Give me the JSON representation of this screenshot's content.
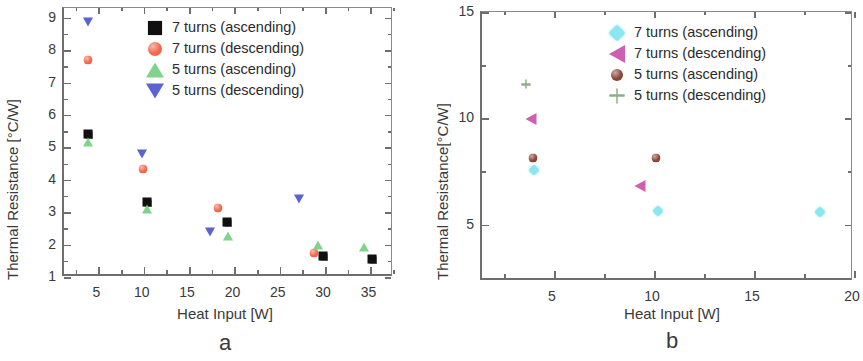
{
  "figure": {
    "panels": [
      {
        "id": "a",
        "letter": "a",
        "xlabel": "Heat Input [W]",
        "ylabel": "Thermal Resistance [°C/W]"
      },
      {
        "id": "b",
        "letter": "b",
        "xlabel": "Heat Input [W]",
        "ylabel": "Thermal Resistance[°C/W]"
      }
    ]
  },
  "chart_data": [
    {
      "type": "scatter",
      "panel": "a",
      "title": "",
      "xlabel": "Heat Input [W]",
      "ylabel": "Thermal Resistance [°C/W]",
      "xlim": [
        1.2,
        37.6
      ],
      "ylim": [
        1,
        9.3
      ],
      "xticks": [
        5,
        10,
        15,
        20,
        25,
        30,
        35
      ],
      "yticks": [
        1,
        2,
        3,
        4,
        5,
        6,
        7,
        8,
        9
      ],
      "xtick_labels": [
        "5",
        "10",
        "15",
        "20",
        "25",
        "30",
        "35"
      ],
      "ytick_labels": [
        "1",
        "2",
        "3",
        "4",
        "5",
        "6",
        "7",
        "8",
        "9"
      ],
      "xminor_step": 2.5,
      "yminor_step": 0.5,
      "grid": false,
      "legend_position": "top-right",
      "series": [
        {
          "name": "7 turns (ascending)",
          "marker": "square",
          "color": "#101010",
          "points": [
            {
              "x": 3.9,
              "y": 5.42
            },
            {
              "x": 10.4,
              "y": 3.32
            },
            {
              "x": 19.2,
              "y": 2.69
            },
            {
              "x": 29.8,
              "y": 1.65
            },
            {
              "x": 35.2,
              "y": 1.55
            }
          ]
        },
        {
          "name": "7 turns (descending)",
          "marker": "circle",
          "color": "#f2664c",
          "points": [
            {
              "x": 3.8,
              "y": 7.7
            },
            {
              "x": 9.9,
              "y": 4.33
            },
            {
              "x": 18.2,
              "y": 3.14
            },
            {
              "x": 28.8,
              "y": 1.73
            }
          ]
        },
        {
          "name": "5 turns (ascending)",
          "marker": "triangle-up",
          "color": "#7fd38a",
          "points": [
            {
              "x": 3.9,
              "y": 5.18
            },
            {
              "x": 10.4,
              "y": 3.11
            },
            {
              "x": 19.3,
              "y": 2.25
            },
            {
              "x": 29.2,
              "y": 1.98
            },
            {
              "x": 34.3,
              "y": 1.92
            }
          ]
        },
        {
          "name": "5 turns (descending)",
          "marker": "triangle-down",
          "color": "#5a63cf",
          "points": [
            {
              "x": 3.8,
              "y": 8.87
            },
            {
              "x": 9.8,
              "y": 4.8
            },
            {
              "x": 17.3,
              "y": 2.4
            },
            {
              "x": 27.1,
              "y": 3.4
            }
          ]
        }
      ]
    },
    {
      "type": "scatter",
      "panel": "b",
      "title": "",
      "xlabel": "Heat Input [W]",
      "ylabel": "Thermal Resistance[°C/W]",
      "xlim": [
        1.4,
        20
      ],
      "ylim": [
        2.35,
        15
      ],
      "xticks": [
        5,
        10,
        15,
        20
      ],
      "yticks": [
        5,
        10,
        15
      ],
      "xtick_labels": [
        "5",
        "10",
        "15",
        "20"
      ],
      "ytick_labels": [
        "5",
        "10",
        "15"
      ],
      "xminor_step": 2.5,
      "yminor_step": 2.5,
      "grid": false,
      "legend_position": "top-right",
      "series": [
        {
          "name": "7 turns (ascending)",
          "marker": "diamond",
          "color": "#8ae6ef",
          "points": [
            {
              "x": 4.0,
              "y": 7.55
            },
            {
              "x": 10.2,
              "y": 5.65
            },
            {
              "x": 18.3,
              "y": 5.58
            }
          ]
        },
        {
          "name": "7 turns (descending)",
          "marker": "triangle-left",
          "color": "#cf5fb0",
          "points": [
            {
              "x": 3.85,
              "y": 9.95
            },
            {
              "x": 9.3,
              "y": 6.8
            }
          ]
        },
        {
          "name": "5 turns (ascending)",
          "marker": "circle",
          "color": "#8a4438",
          "points": [
            {
              "x": 3.95,
              "y": 8.15
            },
            {
              "x": 10.1,
              "y": 8.15
            }
          ]
        },
        {
          "name": "5 turns (descending)",
          "marker": "plus",
          "color": "#8fae86",
          "points": [
            {
              "x": 3.6,
              "y": 11.6
            }
          ]
        }
      ]
    }
  ]
}
